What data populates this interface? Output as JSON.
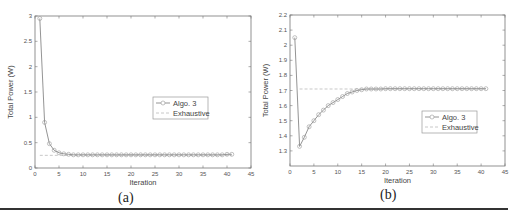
{
  "figure": {
    "captions": [
      "(a)",
      "(b)"
    ]
  },
  "chart_data": [
    {
      "type": "line",
      "panel": "(a)",
      "title": "",
      "xlabel": "Iteration",
      "ylabel": "Total Power (W)",
      "xlim": [
        0,
        45
      ],
      "ylim": [
        0,
        3
      ],
      "xticks": [
        0,
        5,
        10,
        15,
        20,
        25,
        30,
        35,
        40,
        45
      ],
      "yticks": [
        0,
        0.5,
        1,
        1.5,
        2,
        2.5,
        3
      ],
      "ytick_labels": [
        "0",
        "0.5",
        "1",
        "1.5",
        "2",
        "2.5",
        "3"
      ],
      "grid": false,
      "legend": {
        "position": "center-right",
        "entries": [
          "Algo. 3",
          "Exhaustive"
        ]
      },
      "series": [
        {
          "name": "Algo. 3",
          "style": "solid line with circle markers",
          "x": [
            1,
            2,
            3,
            4,
            5,
            6,
            7,
            8,
            9,
            10,
            11,
            12,
            13,
            14,
            15,
            16,
            17,
            18,
            19,
            20,
            21,
            22,
            23,
            24,
            25,
            26,
            27,
            28,
            29,
            30,
            31,
            32,
            33,
            34,
            35,
            36,
            37,
            38,
            39,
            40,
            41
          ],
          "values": [
            2.95,
            0.9,
            0.48,
            0.35,
            0.3,
            0.28,
            0.27,
            0.26,
            0.26,
            0.26,
            0.26,
            0.26,
            0.26,
            0.26,
            0.26,
            0.26,
            0.26,
            0.26,
            0.26,
            0.26,
            0.26,
            0.26,
            0.26,
            0.26,
            0.26,
            0.26,
            0.26,
            0.26,
            0.26,
            0.26,
            0.26,
            0.26,
            0.26,
            0.26,
            0.26,
            0.26,
            0.26,
            0.26,
            0.26,
            0.27,
            0.27
          ]
        },
        {
          "name": "Exhaustive",
          "style": "dashed line",
          "x": [
            1,
            41
          ],
          "values": [
            0.25,
            0.25
          ]
        }
      ]
    },
    {
      "type": "line",
      "panel": "(b)",
      "title": "",
      "xlabel": "Iteration",
      "ylabel": "Total Power (W)",
      "xlim": [
        0,
        45
      ],
      "ylim": [
        1.2,
        2.2
      ],
      "xticks": [
        0,
        5,
        10,
        15,
        20,
        25,
        30,
        35,
        40,
        45
      ],
      "yticks": [
        1.3,
        1.4,
        1.5,
        1.6,
        1.7,
        1.8,
        1.9,
        2.0,
        2.1,
        2.2
      ],
      "ytick_labels": [
        "1.3",
        "1.4",
        "1.5",
        "1.6",
        "1.7",
        "1.8",
        "1.9",
        "2",
        "2.1",
        "2.2"
      ],
      "grid": false,
      "legend": {
        "position": "center-right",
        "entries": [
          "Algo. 3",
          "Exhaustive"
        ]
      },
      "series": [
        {
          "name": "Algo. 3",
          "style": "solid line with circle markers",
          "x": [
            1,
            2,
            3,
            4,
            5,
            6,
            7,
            8,
            9,
            10,
            11,
            12,
            13,
            14,
            15,
            16,
            17,
            18,
            19,
            20,
            21,
            22,
            23,
            24,
            25,
            26,
            27,
            28,
            29,
            30,
            31,
            32,
            33,
            34,
            35,
            36,
            37,
            38,
            39,
            40,
            41
          ],
          "values": [
            2.05,
            1.33,
            1.39,
            1.46,
            1.5,
            1.54,
            1.57,
            1.6,
            1.62,
            1.64,
            1.66,
            1.68,
            1.69,
            1.7,
            1.705,
            1.71,
            1.71,
            1.71,
            1.71,
            1.712,
            1.712,
            1.712,
            1.712,
            1.712,
            1.712,
            1.712,
            1.712,
            1.712,
            1.712,
            1.712,
            1.712,
            1.712,
            1.712,
            1.712,
            1.712,
            1.712,
            1.712,
            1.712,
            1.712,
            1.712,
            1.712
          ]
        },
        {
          "name": "Exhaustive",
          "style": "dashed line",
          "x": [
            2,
            41
          ],
          "values": [
            1.71,
            1.71
          ]
        }
      ]
    }
  ]
}
